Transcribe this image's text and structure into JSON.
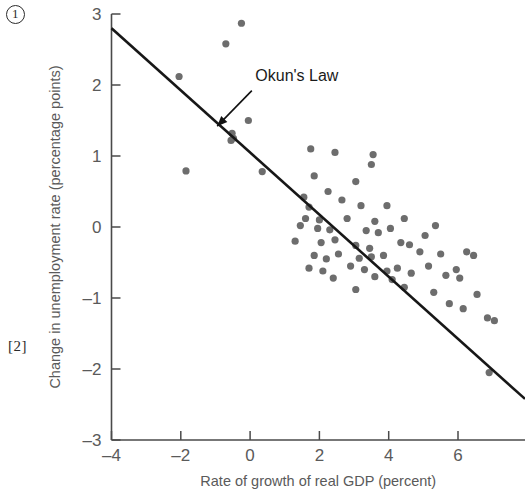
{
  "page": {
    "margin_marks": [
      {
        "id": "circled-one",
        "text": "1"
      },
      {
        "id": "bracket-two",
        "text": "[2]"
      }
    ]
  },
  "chart_data": {
    "type": "scatter",
    "title": "",
    "xlabel": "Rate of growth of real GDP (percent)",
    "ylabel": "Change in unemployment rate (percentage points)",
    "xlim": [
      -4,
      8
    ],
    "ylim": [
      -3,
      3
    ],
    "xticks": [
      -4,
      -2,
      0,
      2,
      4,
      6,
      8
    ],
    "xtick_labels": [
      "-4",
      "-2",
      "0",
      "2",
      "4",
      "6",
      "8"
    ],
    "yticks": [
      -3,
      -2,
      -1,
      0,
      1,
      2,
      3
    ],
    "ytick_labels": [
      "-3",
      "-2",
      "-1",
      "0",
      "1",
      "2",
      "3"
    ],
    "grid": false,
    "legend": null,
    "annotations": [
      {
        "text": "Okun's Law",
        "label_x": 0.15,
        "label_y": 2.05,
        "arrow_from_x": 0.05,
        "arrow_from_y": 1.92,
        "arrow_to_x": -0.95,
        "arrow_to_y": 1.42
      }
    ],
    "trendline": {
      "name": "Okun's Law",
      "x_start": -4.0,
      "y_start": 2.8,
      "x_end": 8.0,
      "y_end": -2.45,
      "slope": -0.4375,
      "intercept": 1.05,
      "color": "#171717"
    },
    "series": [
      {
        "name": "Annual observations",
        "marker": "circle",
        "color": "#6d6d6d",
        "points": [
          [
            -0.25,
            2.87
          ],
          [
            -0.7,
            2.58
          ],
          [
            -2.05,
            2.12
          ],
          [
            -0.05,
            1.5
          ],
          [
            -0.52,
            1.32
          ],
          [
            -0.55,
            1.22
          ],
          [
            -0.48,
            1.25
          ],
          [
            1.75,
            1.1
          ],
          [
            2.45,
            1.05
          ],
          [
            3.55,
            1.02
          ],
          [
            3.5,
            0.88
          ],
          [
            -1.85,
            0.79
          ],
          [
            0.35,
            0.78
          ],
          [
            1.85,
            0.72
          ],
          [
            3.05,
            0.64
          ],
          [
            2.25,
            0.5
          ],
          [
            1.55,
            0.42
          ],
          [
            2.65,
            0.38
          ],
          [
            3.2,
            0.3
          ],
          [
            1.7,
            0.28
          ],
          [
            3.95,
            0.3
          ],
          [
            1.6,
            0.12
          ],
          [
            2.0,
            0.1
          ],
          [
            2.8,
            0.12
          ],
          [
            3.6,
            0.08
          ],
          [
            4.45,
            0.12
          ],
          [
            1.45,
            0.02
          ],
          [
            1.95,
            -0.02
          ],
          [
            2.3,
            -0.04
          ],
          [
            3.35,
            -0.05
          ],
          [
            3.7,
            -0.08
          ],
          [
            4.05,
            -0.02
          ],
          [
            5.35,
            0.02
          ],
          [
            1.3,
            -0.2
          ],
          [
            2.05,
            -0.22
          ],
          [
            2.45,
            -0.18
          ],
          [
            3.05,
            -0.26
          ],
          [
            3.45,
            -0.3
          ],
          [
            4.35,
            -0.22
          ],
          [
            4.6,
            -0.25
          ],
          [
            5.05,
            -0.12
          ],
          [
            1.85,
            -0.4
          ],
          [
            2.2,
            -0.45
          ],
          [
            2.55,
            -0.38
          ],
          [
            3.15,
            -0.44
          ],
          [
            3.5,
            -0.42
          ],
          [
            3.85,
            -0.4
          ],
          [
            4.9,
            -0.35
          ],
          [
            5.5,
            -0.38
          ],
          [
            6.25,
            -0.35
          ],
          [
            6.45,
            -0.4
          ],
          [
            1.7,
            -0.58
          ],
          [
            2.1,
            -0.62
          ],
          [
            2.9,
            -0.55
          ],
          [
            3.3,
            -0.6
          ],
          [
            3.95,
            -0.62
          ],
          [
            4.25,
            -0.58
          ],
          [
            4.65,
            -0.65
          ],
          [
            5.15,
            -0.55
          ],
          [
            5.95,
            -0.6
          ],
          [
            2.4,
            -0.72
          ],
          [
            3.6,
            -0.7
          ],
          [
            4.1,
            -0.74
          ],
          [
            5.65,
            -0.68
          ],
          [
            6.05,
            -0.72
          ],
          [
            3.05,
            -0.88
          ],
          [
            4.45,
            -0.85
          ],
          [
            5.3,
            -0.92
          ],
          [
            6.55,
            -0.95
          ],
          [
            5.75,
            -1.08
          ],
          [
            6.15,
            -1.15
          ],
          [
            6.85,
            -1.28
          ],
          [
            7.05,
            -1.32
          ],
          [
            6.9,
            -2.05
          ]
        ]
      }
    ]
  }
}
